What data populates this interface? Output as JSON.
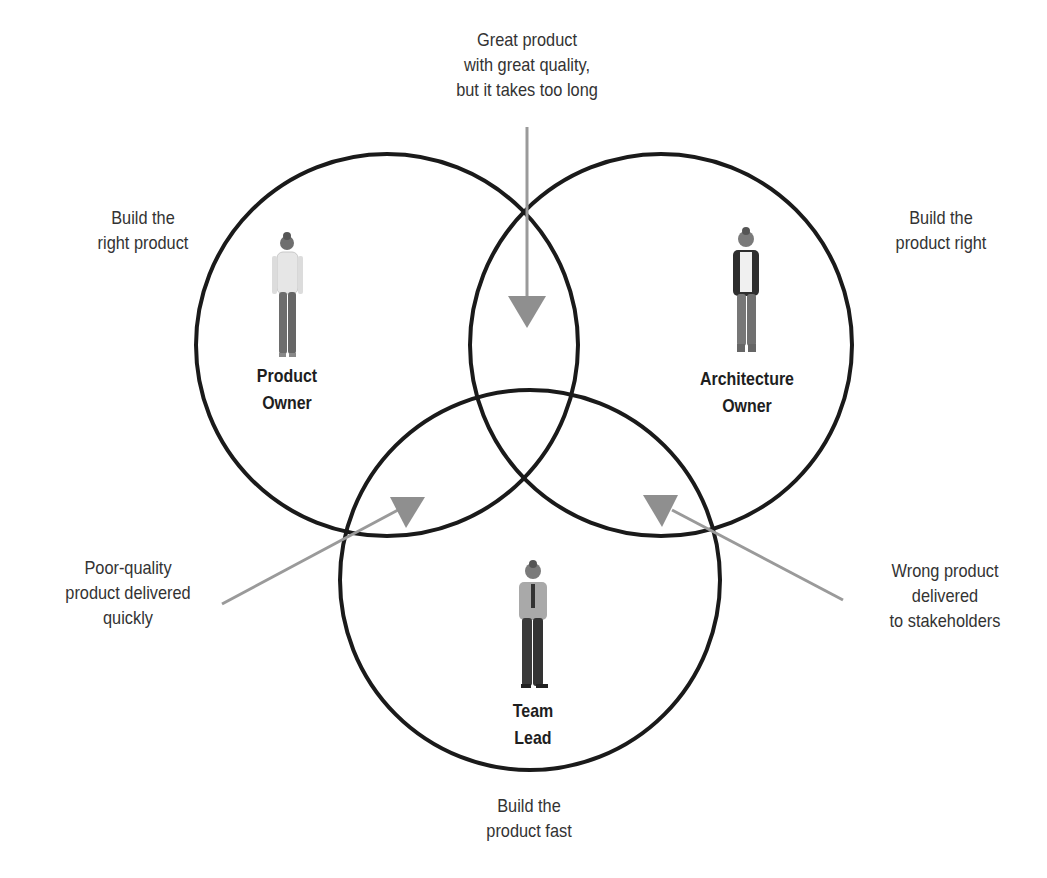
{
  "diagram": {
    "type": "three-circle venn",
    "circles": [
      {
        "id": "product-owner",
        "role": [
          "Product",
          "Owner"
        ],
        "goal": [
          "Build the",
          "right product"
        ],
        "cx": 387,
        "cy": 345,
        "r": 191
      },
      {
        "id": "architecture-owner",
        "role": [
          "Architecture",
          "Owner"
        ],
        "goal": [
          "Build the",
          "product right"
        ],
        "cx": 661,
        "cy": 345,
        "r": 191
      },
      {
        "id": "team-lead",
        "role": [
          "Team",
          "Lead"
        ],
        "goal": [
          "Build the",
          "product fast"
        ],
        "cx": 530,
        "cy": 580,
        "r": 190
      }
    ],
    "overlaps": [
      {
        "id": "po-ao",
        "between": [
          "Product Owner",
          "Architecture Owner"
        ],
        "text": [
          "Great product",
          "with great quality,",
          "but it takes too long"
        ]
      },
      {
        "id": "po-tl",
        "between": [
          "Product Owner",
          "Team Lead"
        ],
        "text": [
          "Poor-quality",
          "product delivered",
          "quickly"
        ]
      },
      {
        "id": "ao-tl",
        "between": [
          "Architecture Owner",
          "Team Lead"
        ],
        "text": [
          "Wrong product",
          "delivered",
          "to stakeholders"
        ]
      }
    ],
    "colors": {
      "circle_stroke": "#1a1a1a",
      "arrow": "#9a9a9a",
      "text": "#333333"
    }
  }
}
